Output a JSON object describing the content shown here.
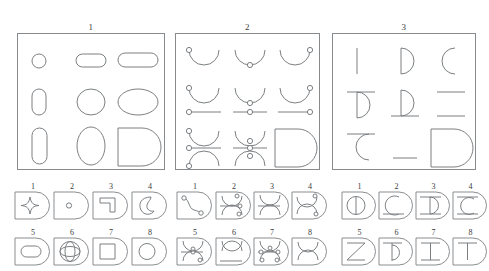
{
  "page": {
    "kind": "visual-reasoning-worksheet",
    "ink_color": "#7c7f82",
    "background_color": "#ffffff"
  },
  "puzzles": [
    {
      "label": "1",
      "grid": [
        [
          "small-circle",
          "small-rounded-rect-horizontal",
          "wide-rounded-rect-horizontal"
        ],
        [
          "small-rounded-rect-vertical",
          "circle",
          "wide-ellipse"
        ],
        [
          "tall-rounded-rect-vertical",
          "tall-ellipse",
          "missing-cell-d-shape"
        ]
      ]
    },
    {
      "label": "2",
      "grid": [
        [
          "arc-up-dot-left",
          "arc-up-dot-bottom",
          "arc-up-dot-right"
        ],
        [
          "arc-up-with-line-dots-left",
          "arc-up-with-line-dots-center",
          "arc-up-with-line-dots-right"
        ],
        [
          "arc-line-arc-stack-left",
          "arc-line-arc-stack-center",
          "missing-cell-d-shape"
        ]
      ]
    },
    {
      "label": "3",
      "grid": [
        [
          "vertical-bar",
          "half-disc-right-with-bar",
          "open-arc-left"
        ],
        [
          "half-disc-with-top-line",
          "half-disc-with-bottom-line",
          "two-horizontal-lines"
        ],
        [
          "arc-with-top-line",
          "single-horizontal-line",
          "missing-cell-d-shape"
        ]
      ]
    }
  ],
  "answer_groups": [
    {
      "for_puzzle": "1",
      "options": [
        {
          "number": "1",
          "shape": "four-pointed-star"
        },
        {
          "number": "2",
          "shape": "tiny-circle"
        },
        {
          "number": "3",
          "shape": "hook-bent-bar"
        },
        {
          "number": "4",
          "shape": "crescent-blob"
        },
        {
          "number": "5",
          "shape": "rounded-rect-horizontal"
        },
        {
          "number": "6",
          "shape": "circle-with-ellipses-overlay"
        },
        {
          "number": "7",
          "shape": "square"
        },
        {
          "number": "8",
          "shape": "circle"
        }
      ]
    },
    {
      "for_puzzle": "2",
      "options": [
        {
          "number": "1",
          "shape": "s-curve-with-two-dots"
        },
        {
          "number": "2",
          "shape": "arc-up-line-arc-down-dots-right"
        },
        {
          "number": "3",
          "shape": "arc-down-line-arc-up-no-dots"
        },
        {
          "number": "4",
          "shape": "arc-down-arc-up-dots-corner"
        },
        {
          "number": "5",
          "shape": "arc-up-line-arc-up-dots"
        },
        {
          "number": "6",
          "shape": "arc-up-arc-down-line"
        },
        {
          "number": "7",
          "shape": "arc-up-line-arc-up-dots-both"
        },
        {
          "number": "8",
          "shape": "arc-down-arc-up-touching"
        }
      ]
    },
    {
      "for_puzzle": "3",
      "options": [
        {
          "number": "1",
          "shape": "circle-with-vertical-diameter"
        },
        {
          "number": "2",
          "shape": "open-arc-left-with-base-line"
        },
        {
          "number": "3",
          "shape": "i-beam-with-arc"
        },
        {
          "number": "4",
          "shape": "c-with-top-and-bottom-line"
        },
        {
          "number": "5",
          "shape": "z-zigzag"
        },
        {
          "number": "6",
          "shape": "half-disc-with-vertical-bar"
        },
        {
          "number": "7",
          "shape": "i-beam"
        },
        {
          "number": "8",
          "shape": "t-shape"
        }
      ]
    }
  ]
}
